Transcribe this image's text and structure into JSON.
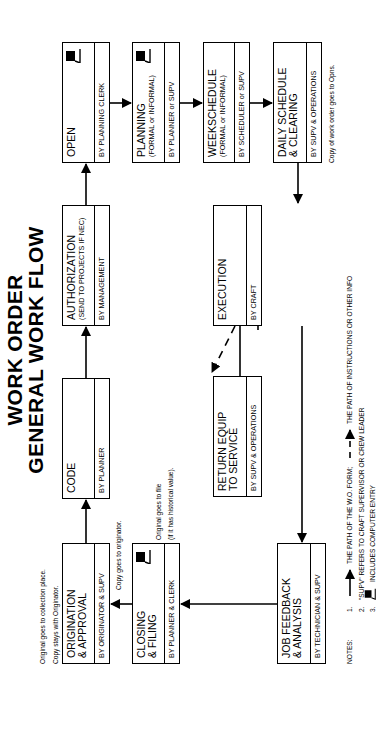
{
  "title": {
    "line1": "WORK ORDER",
    "line2": "GENERAL WORK FLOW"
  },
  "boxes": {
    "open": {
      "title": "OPEN",
      "by": "BY PLANNING CLERK",
      "computer_entry": true
    },
    "planning": {
      "title": "PLANNING",
      "subtitle": "(FORMAL or INFORMAL)",
      "by": "BY PLANNER or SUPV",
      "computer_entry": true
    },
    "week_schedule": {
      "title": "WEEKSCHEDULE",
      "subtitle": "(FORMAL or INFORMAL)",
      "by": "BY SCHEDULER or SUPV"
    },
    "daily_schedule": {
      "title": "DAILY SCHEDULE",
      "title2": "& CLEARING",
      "by": "BY SUPV & OPERATIONS"
    },
    "authorization": {
      "title": "AUTHORIZATION",
      "subtitle": "(SEND TO PROJECTS IF NEC)",
      "by": "BY MANAGEMENT"
    },
    "code": {
      "title": "CODE",
      "by": "BY PLANNER"
    },
    "origination": {
      "title": "ORIGINATION",
      "title2": "& APPROVAL",
      "by": "BY ORIGINATOR & SUPV"
    },
    "closing": {
      "title": "CLOSING",
      "title2": "& FILING",
      "by": "BY PLANNER & CLERK",
      "computer_entry": true
    },
    "return_equip": {
      "title": "RETURN EQUIP",
      "title2": "TO SERVICE",
      "by": "BY SUPV & OPERATIONS"
    },
    "execution": {
      "title": "EXECUTION",
      "by": "BY CRAFT"
    },
    "job_feedback": {
      "title": "JOB FEEDBACK",
      "title2": "& ANALYSIS",
      "by": "BY TECHNICIAN & SUPV"
    }
  },
  "annotations": {
    "origination_1": "Original goes to collection place.",
    "origination_2": "Copy stays with Originator.",
    "closing_copy": "Copy goes to originator.",
    "closing_file_1": "Original goes to file",
    "closing_file_2": "(if it has historical value).",
    "daily_copy": "Copy of work order goes to Opns."
  },
  "notes": {
    "label": "NOTES:",
    "items": [
      {
        "num": "1.",
        "text_a": "THE PATH OF THE W.O. FORM;",
        "text_b": "THE PATH OF INSTRUCTIONS OR OTHER INFO"
      },
      {
        "num": "2.",
        "text": "\"SUPV\" REFERS TO CRAFT SUPERVISOR OR CREW LEADER"
      },
      {
        "num": "3.",
        "text": "INCLUDES COMPUTER ENTRY"
      }
    ]
  }
}
